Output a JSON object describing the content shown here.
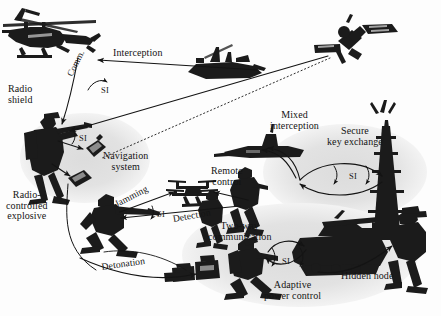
{
  "figure": {
    "kind": "military-electronic-warfare-scenario-diagram",
    "background_color": "#fdfdfd",
    "ink_color": "#141414",
    "zone_fill_color": "#e3e3e3",
    "silhouette_color": "#1b1b1b"
  },
  "labels": [
    {
      "id": "interception",
      "text": "Interception",
      "x": 113,
      "y": 48,
      "size": "m1",
      "align": "left"
    },
    {
      "id": "si-1",
      "text": "SI",
      "x": 101,
      "y": 86,
      "size": "si",
      "align": "left"
    },
    {
      "id": "comm",
      "text": "Comm.",
      "x": 66,
      "y": 74,
      "size": "m3",
      "align": "left",
      "rotate": -64
    },
    {
      "id": "radio-shield",
      "text": "Radio\nshield",
      "x": 8,
      "y": 84,
      "size": "m1",
      "align": "left"
    },
    {
      "id": "si-2",
      "text": "SI",
      "x": 79,
      "y": 134,
      "size": "si",
      "align": "left"
    },
    {
      "id": "navigation-system",
      "text": "Navigation\nsystem",
      "x": 103,
      "y": 151,
      "size": "m1",
      "align": "left"
    },
    {
      "id": "radio-controlled-explosive",
      "text": "Radio-\ncontrolled\nexplosive",
      "x": 6,
      "y": 190,
      "size": "m1",
      "align": "left"
    },
    {
      "id": "jamming",
      "text": "Jamming",
      "x": 113,
      "y": 200,
      "size": "m2",
      "align": "left",
      "rotate": -27
    },
    {
      "id": "si-3",
      "text": "SI",
      "x": 157,
      "y": 210,
      "size": "si",
      "align": "left"
    },
    {
      "id": "detection",
      "text": "Detection",
      "x": 172,
      "y": 214,
      "size": "m2",
      "align": "left",
      "rotate": -10
    },
    {
      "id": "detonation",
      "text": "Detonation",
      "x": 101,
      "y": 262,
      "size": "m2",
      "align": "left",
      "rotate": -8
    },
    {
      "id": "remote-control",
      "text": "Remote\ncontrol",
      "x": 211,
      "y": 166,
      "size": "m1",
      "align": "left"
    },
    {
      "id": "mixed-interception",
      "text": "Mixed\ninterception",
      "x": 270,
      "y": 110,
      "size": "m1",
      "align": "left"
    },
    {
      "id": "secure-key-exchange",
      "text": "Secure\nkey exchange",
      "x": 327,
      "y": 126,
      "size": "m1",
      "align": "left"
    },
    {
      "id": "si-4",
      "text": "SI",
      "x": 349,
      "y": 172,
      "size": "si",
      "align": "left"
    },
    {
      "id": "two-way-communication",
      "text": "Two-way\ncommunication",
      "x": 208,
      "y": 221,
      "size": "m1",
      "align": "left"
    },
    {
      "id": "si-5",
      "text": "SI",
      "x": 282,
      "y": 257,
      "size": "si",
      "align": "left"
    },
    {
      "id": "adaptive-power-control",
      "text": "Adaptive\npower control",
      "x": 264,
      "y": 280,
      "size": "m1",
      "align": "left"
    },
    {
      "id": "hidden-node",
      "text": "Hidden node",
      "x": 341,
      "y": 271,
      "size": "m1",
      "align": "left"
    }
  ],
  "entities": [
    {
      "id": "attack-helicopter",
      "name": "attack-helicopter"
    },
    {
      "id": "naval-warship",
      "name": "naval-warship"
    },
    {
      "id": "satellite",
      "name": "satellite"
    },
    {
      "id": "soldier-with-rifle",
      "name": "soldier-with-rifle"
    },
    {
      "id": "navigation-device",
      "name": "handheld-navigation-device"
    },
    {
      "id": "radio-explosive-device",
      "name": "radio-controlled-explosive-device"
    },
    {
      "id": "quadcopter-drone",
      "name": "quadcopter-drone"
    },
    {
      "id": "kneeling-soldier",
      "name": "kneeling-soldier-operator"
    },
    {
      "id": "submarine",
      "name": "submarine"
    },
    {
      "id": "standing-soldier-left",
      "name": "standing-soldier"
    },
    {
      "id": "radio-operator-soldier",
      "name": "radio-operator-soldier"
    },
    {
      "id": "comms-tower",
      "name": "communications-tower"
    },
    {
      "id": "battle-tank",
      "name": "main-battle-tank"
    },
    {
      "id": "hidden-node-soldier",
      "name": "hidden-node-soldier"
    },
    {
      "id": "field-equipment-cases",
      "name": "field-equipment-cases"
    },
    {
      "id": "crouching-radio-soldier",
      "name": "crouching-radio-soldier"
    }
  ],
  "zones": [
    {
      "id": "zone-radio-shield",
      "name": "radio-shield-coverage-zone"
    },
    {
      "id": "zone-secure-link",
      "name": "secure-key-exchange-zone"
    },
    {
      "id": "zone-adaptive-power",
      "name": "adaptive-power-control-zone"
    }
  ],
  "links": [
    {
      "id": "link-warship-helicopter",
      "label": "Interception"
    },
    {
      "id": "link-helicopter-soldier",
      "label": "Comm."
    },
    {
      "id": "link-satellite-soldier",
      "label": ""
    },
    {
      "id": "link-soldier-navigation",
      "label": ""
    },
    {
      "id": "link-soldier-explosive",
      "label": ""
    },
    {
      "id": "link-kneeling-drone",
      "label": "Jamming"
    },
    {
      "id": "link-drone-kneeling",
      "label": "Detection"
    },
    {
      "id": "link-remote-control-drone",
      "label": "Remote control"
    },
    {
      "id": "link-explosive-detonation",
      "label": "Detonation"
    },
    {
      "id": "link-radio-submarine",
      "label": "Mixed interception"
    },
    {
      "id": "link-radio-tower",
      "label": "Secure key exchange"
    },
    {
      "id": "link-soldier-tank",
      "label": "Two-way communication"
    },
    {
      "id": "link-tank-hidden-node",
      "label": "Hidden node"
    },
    {
      "id": "link-adaptive-power",
      "label": "Adaptive power control"
    }
  ]
}
